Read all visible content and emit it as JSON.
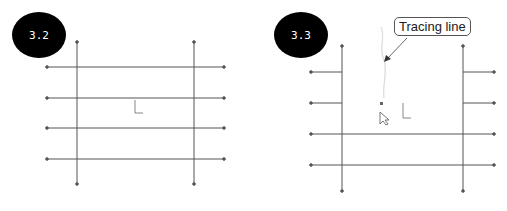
{
  "panels": [
    {
      "id": "panel-3-2",
      "badge": "3.2"
    },
    {
      "id": "panel-3-3",
      "badge": "3.3",
      "callout": "Tracing line"
    }
  ]
}
